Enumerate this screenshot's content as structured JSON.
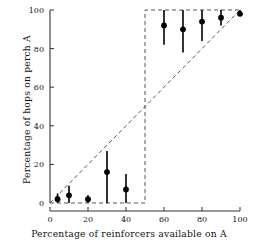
{
  "chart_data": {
    "type": "scatter",
    "title": "",
    "xlabel": "Percentage of reinforcers available on A",
    "ylabel": "Percentage of hops on perch A",
    "xlim": [
      0,
      100
    ],
    "ylim": [
      0,
      100
    ],
    "xticks": [
      0,
      20,
      40,
      60,
      80,
      100
    ],
    "yticks": [
      0,
      20,
      40,
      60,
      80,
      100
    ],
    "xticklabels": [
      "0",
      "20",
      "40",
      "60",
      "80",
      "100"
    ],
    "yticklabels": [
      "0",
      "20",
      "40",
      "60",
      "80",
      "100"
    ],
    "grid": false,
    "legend": null,
    "series": [
      {
        "name": "Percentage of hops on perch A",
        "marker": "filled-circle",
        "errorbars": "vertical",
        "points": [
          {
            "x": 4,
            "y": 2,
            "ylow": 0,
            "yhigh": 5
          },
          {
            "x": 10,
            "y": 4,
            "ylow": 0,
            "yhigh": 9
          },
          {
            "x": 20,
            "y": 2,
            "ylow": 0,
            "yhigh": 4
          },
          {
            "x": 30,
            "y": 16,
            "ylow": 0,
            "yhigh": 27
          },
          {
            "x": 40,
            "y": 7,
            "ylow": 0,
            "yhigh": 15
          },
          {
            "x": 60,
            "y": 92,
            "ylow": 82,
            "yhigh": 100
          },
          {
            "x": 70,
            "y": 90,
            "ylow": 78,
            "yhigh": 100
          },
          {
            "x": 80,
            "y": 94,
            "ylow": 84,
            "yhigh": 100
          },
          {
            "x": 90,
            "y": 96,
            "ylow": 92,
            "yhigh": 100
          },
          {
            "x": 100,
            "y": 98,
            "ylow": 97,
            "yhigh": 100
          }
        ]
      }
    ],
    "reference_lines": [
      {
        "name": "matching-line",
        "style": "dashed",
        "points": [
          [
            0,
            0
          ],
          [
            100,
            100
          ]
        ]
      },
      {
        "name": "maximizing-step-line",
        "style": "dashed",
        "points": [
          [
            0,
            0
          ],
          [
            50,
            0
          ],
          [
            50,
            100
          ],
          [
            100,
            100
          ]
        ]
      }
    ],
    "colors": {
      "marker": "#000000",
      "errorbar": "#000000",
      "reference_line": "#555555",
      "axis": "#333333",
      "background": "#ffffff"
    }
  }
}
